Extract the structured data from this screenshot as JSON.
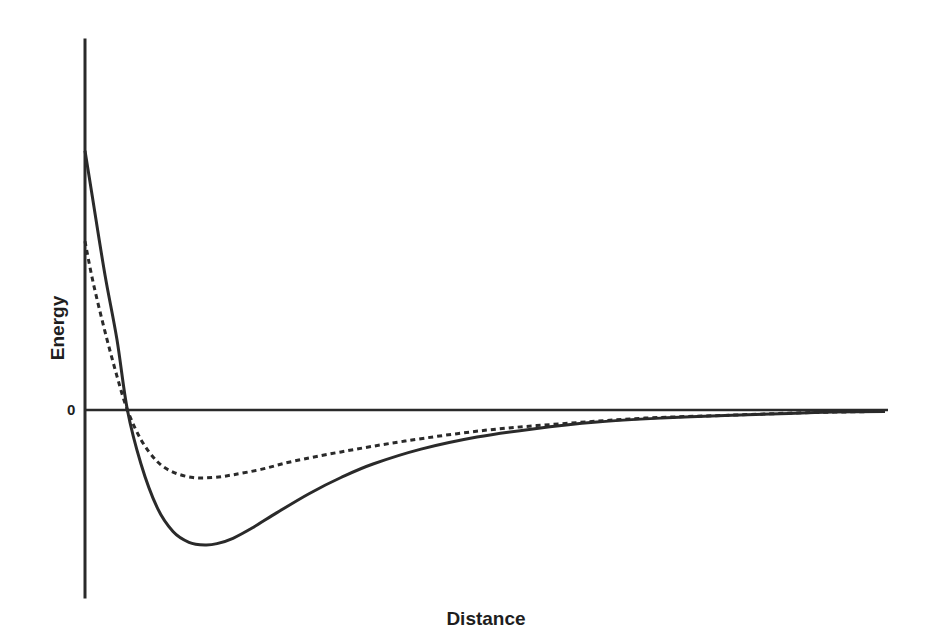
{
  "chart_data": {
    "type": "line",
    "title": "",
    "xlabel": "Distance",
    "ylabel": "Energy",
    "y_tick_labels": [
      "0"
    ],
    "grid": false,
    "legend": null,
    "xlim": [
      0,
      1
    ],
    "ylim": [
      -1.0,
      1.9
    ],
    "series": [
      {
        "name": "solid potential (deeper well)",
        "style": "solid",
        "x": [
          0.0,
          0.01,
          0.025,
          0.04,
          0.053,
          0.07,
          0.09,
          0.11,
          0.13,
          0.15,
          0.165,
          0.185,
          0.21,
          0.24,
          0.28,
          0.32,
          0.36,
          0.42,
          0.49,
          0.56,
          0.64,
          0.72,
          0.8,
          0.88,
          0.935,
          1.0
        ],
        "y": [
          1.92,
          1.55,
          1.0,
          0.52,
          0.0,
          -0.4,
          -0.72,
          -0.9,
          -0.98,
          -1.0,
          -0.99,
          -0.95,
          -0.87,
          -0.76,
          -0.62,
          -0.5,
          -0.4,
          -0.29,
          -0.2,
          -0.14,
          -0.09,
          -0.06,
          -0.04,
          -0.025,
          -0.015,
          -0.01
        ]
      },
      {
        "name": "dashed potential (shallower well)",
        "style": "dashed",
        "x": [
          0.0,
          0.01,
          0.025,
          0.04,
          0.053,
          0.07,
          0.09,
          0.11,
          0.135,
          0.16,
          0.185,
          0.22,
          0.26,
          0.32,
          0.4,
          0.5,
          0.6,
          0.7,
          0.8,
          0.9,
          1.0
        ],
        "y": [
          1.25,
          0.95,
          0.58,
          0.25,
          0.0,
          -0.22,
          -0.38,
          -0.46,
          -0.5,
          -0.5,
          -0.48,
          -0.44,
          -0.38,
          -0.31,
          -0.23,
          -0.15,
          -0.1,
          -0.06,
          -0.04,
          -0.02,
          -0.01
        ]
      }
    ]
  },
  "layout": {
    "plot_left_px": 85,
    "plot_right_px": 885,
    "zero_y_px": 410,
    "unit_px": 135,
    "axis_top_px": 40,
    "axis_bottom_px": 597
  },
  "colors": {
    "line": "#2a2a2a",
    "text": "#1e1e1e",
    "background": "#ffffff"
  }
}
